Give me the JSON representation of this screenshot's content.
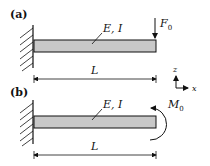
{
  "panel_a": {
    "label": "(a)",
    "material": "E, I",
    "force_symbol": "F",
    "force_sub": "0",
    "length": "L"
  },
  "panel_b": {
    "label": "(b)",
    "material": "E, I",
    "moment_symbol": "M",
    "moment_sub": "0",
    "length": "L"
  },
  "axes": {
    "z_label": "z",
    "x_label": "x"
  },
  "colors": {
    "beam_fill": "#c8c8c8",
    "line": "#111111"
  }
}
